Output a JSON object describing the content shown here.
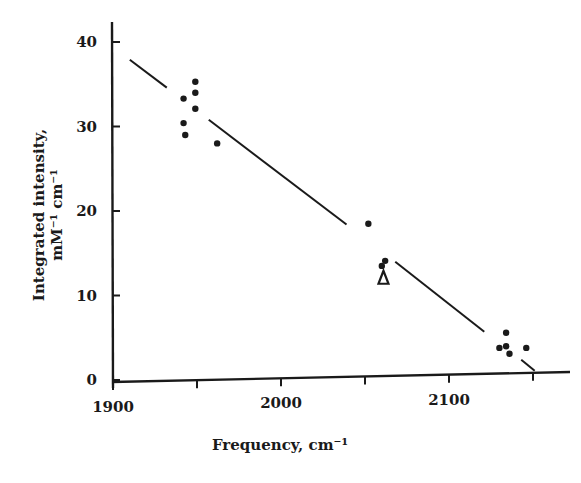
{
  "chart_data": {
    "type": "scatter",
    "title": "",
    "xlabel": "Frequency, cm⁻¹",
    "ylabel_line1": "Integrated intensity,",
    "ylabel_line2": "mM⁻¹ cm⁻¹",
    "xlim": [
      1900,
      2160
    ],
    "ylim": [
      0,
      42
    ],
    "xticks": [
      1900,
      1950,
      2000,
      2050,
      2100,
      2150
    ],
    "xtick_labels": [
      "1900",
      "",
      "2000",
      "",
      "2100",
      ""
    ],
    "yticks": [
      0,
      10,
      20,
      30,
      40
    ],
    "ytick_labels": [
      "0",
      "10",
      "20",
      "30",
      "40"
    ],
    "grid": false,
    "legend": null,
    "series": [
      {
        "name": "measured",
        "marker": "dot",
        "points": [
          {
            "x": 1942,
            "y": 33.3
          },
          {
            "x": 1949,
            "y": 35.3
          },
          {
            "x": 1949,
            "y": 34.0
          },
          {
            "x": 1949,
            "y": 32.1
          },
          {
            "x": 1942,
            "y": 30.4
          },
          {
            "x": 1943,
            "y": 29.0
          },
          {
            "x": 1962,
            "y": 28.0
          },
          {
            "x": 2052,
            "y": 18.5
          },
          {
            "x": 2062,
            "y": 14.1
          },
          {
            "x": 2060,
            "y": 13.5
          },
          {
            "x": 2134,
            "y": 5.6
          },
          {
            "x": 2130,
            "y": 3.8
          },
          {
            "x": 2134,
            "y": 4.0
          },
          {
            "x": 2136,
            "y": 3.1
          },
          {
            "x": 2146,
            "y": 3.8
          }
        ]
      },
      {
        "name": "special",
        "marker": "triangle-open",
        "points": [
          {
            "x": 2061,
            "y": 12.1
          }
        ]
      }
    ],
    "fit_line": {
      "style": "solid, broken where it passes data clusters",
      "segments": [
        [
          {
            "x": 1910,
            "y": 37.9
          },
          {
            "x": 1932,
            "y": 34.6
          }
        ],
        [
          {
            "x": 1957,
            "y": 30.8
          },
          {
            "x": 2039,
            "y": 18.4
          }
        ],
        [
          {
            "x": 2068,
            "y": 14.0
          },
          {
            "x": 2121,
            "y": 5.7
          }
        ],
        [
          {
            "x": 2143,
            "y": 2.4
          },
          {
            "x": 2151,
            "y": 1.1
          }
        ]
      ]
    }
  }
}
